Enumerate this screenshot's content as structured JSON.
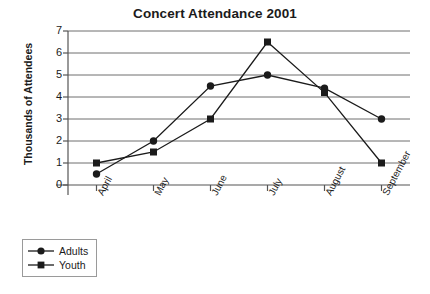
{
  "chart_data": {
    "type": "line",
    "title": "Concert Attendance 2001",
    "xlabel": "",
    "ylabel": "Thousands of Attendees",
    "categories": [
      "April",
      "May",
      "June",
      "July",
      "August",
      "September"
    ],
    "ylim": [
      0,
      7
    ],
    "yticks": [
      0,
      1,
      2,
      3,
      4,
      5,
      6,
      7
    ],
    "grid": true,
    "legend_position": "bottom-left",
    "series": [
      {
        "name": "Adults",
        "marker": "circle",
        "color": "#1b1b1b",
        "values": [
          0.5,
          2.0,
          4.5,
          5.0,
          4.4,
          3.0
        ]
      },
      {
        "name": "Youth",
        "marker": "square",
        "color": "#1b1b1b",
        "values": [
          1.0,
          1.5,
          3.0,
          6.5,
          4.2,
          1.0
        ]
      }
    ]
  },
  "ytick_labels": [
    "7",
    "6",
    "5",
    "4",
    "3",
    "2",
    "1",
    "0"
  ],
  "legend": {
    "items": [
      {
        "label": "Adults",
        "marker": "circle-marker"
      },
      {
        "label": "Youth",
        "marker": "square-marker"
      }
    ]
  },
  "colors": {
    "axis": "#555555",
    "grid": "#6e6e6e",
    "series": "#1b1b1b",
    "text": "#1b1b1b",
    "legend_border": "#9a9a9a",
    "background": "#ffffff"
  }
}
